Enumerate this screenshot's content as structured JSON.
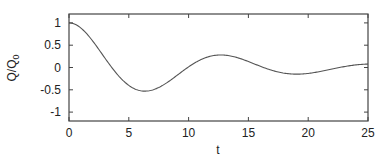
{
  "chart_data": {
    "type": "line",
    "title": "",
    "xlabel": "t",
    "ylabel": "Q/Q",
    "ylabel_subscript": "0",
    "xlim": [
      0,
      25
    ],
    "ylim": [
      -1.2,
      1.2
    ],
    "xticks": [
      0,
      5,
      10,
      15,
      20,
      25
    ],
    "xtick_labels": [
      "0",
      "5",
      "10",
      "15",
      "20",
      "25"
    ],
    "yticks": [
      1,
      0.5,
      0,
      -0.5,
      -1
    ],
    "ytick_labels": [
      "1",
      "0.5",
      "0",
      "-0.5",
      "-1"
    ],
    "grid": false,
    "legend": null,
    "series": [
      {
        "name": "Q/Q0",
        "color": "#555555",
        "x": [
          0,
          1,
          2,
          3,
          4,
          5,
          6,
          6.4,
          7,
          8,
          9,
          10,
          11,
          12,
          12.8,
          13,
          14,
          15,
          16,
          17,
          18,
          19,
          19.4,
          20,
          21,
          22,
          23,
          24,
          25
        ],
        "values": [
          1.0,
          0.88,
          0.6,
          0.24,
          -0.1,
          -0.36,
          -0.51,
          -0.53,
          -0.51,
          -0.41,
          -0.24,
          -0.05,
          0.12,
          0.23,
          0.26,
          0.26,
          0.22,
          0.13,
          0.02,
          -0.08,
          -0.15,
          -0.17,
          -0.17,
          -0.16,
          -0.11,
          -0.05,
          0.01,
          0.04,
          0.05
        ]
      }
    ],
    "model": {
      "form": "exp(-a t) (cos(w t) + (a/w) sin(w t))",
      "a": 0.1,
      "w": 0.495
    }
  },
  "plot": {
    "frame_color": "#444444",
    "background": "#ffffff"
  }
}
